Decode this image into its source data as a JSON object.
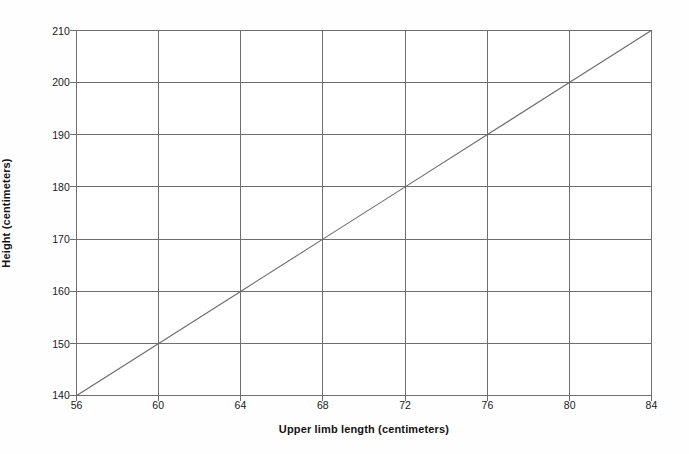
{
  "chart_data": {
    "type": "line",
    "title": "",
    "subtitle": "",
    "xlabel": "Upper limb length (centimeters)",
    "ylabel": "Height (centimeters)",
    "xlim": [
      56,
      84
    ],
    "ylim": [
      140,
      210
    ],
    "xticks": [
      56,
      60,
      64,
      68,
      72,
      76,
      80,
      84
    ],
    "yticks": [
      140,
      150,
      160,
      170,
      180,
      190,
      200,
      210
    ],
    "xtick_labels": [
      "56",
      "60",
      "64",
      "68",
      "72",
      "76",
      "80",
      "84"
    ],
    "ytick_labels": [
      "140",
      "150",
      "160",
      "170",
      "180",
      "190",
      "200",
      "210"
    ],
    "grid": true,
    "grid_color": "#6f6f6f",
    "legend": null,
    "legend_position": "none",
    "annotations": [],
    "series": [
      {
        "name": "Height vs upper limb length",
        "color": "#6b6b6b",
        "line_width": 1.1,
        "marker": "none",
        "x": [
          56,
          60,
          64,
          68,
          72,
          76,
          80,
          84
        ],
        "values": [
          140,
          150,
          160,
          170,
          180,
          190,
          200,
          210
        ],
        "slope": 2.5,
        "intercept": 0
      }
    ]
  },
  "figure": {
    "background_color": "#fefefe",
    "plot_background_color": "#ffffff",
    "axis_color": "#6f6f6f",
    "text_color": "#202020"
  }
}
